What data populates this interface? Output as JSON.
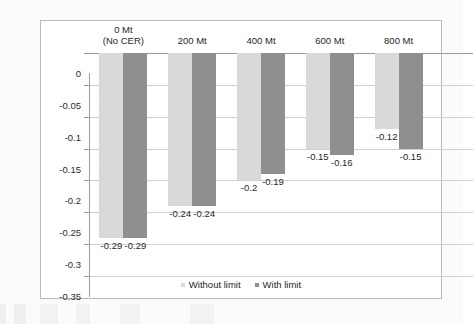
{
  "chart_data": {
    "type": "bar",
    "title": "",
    "subtitle": "",
    "xlabel": "",
    "ylabel": "",
    "categories": [
      "0 Mt\n(No CER)",
      "200 Mt",
      "400 Mt",
      "600 Mt",
      "800 Mt"
    ],
    "category_lines": [
      [
        "0 Mt",
        "(No CER)"
      ],
      [
        "200 Mt"
      ],
      [
        "400 Mt"
      ],
      [
        "600 Mt"
      ],
      [
        "800 Mt"
      ]
    ],
    "series": [
      {
        "name": "Without limit",
        "color": "#d9d9d9",
        "values": [
          -0.29,
          -0.24,
          -0.2,
          -0.15,
          -0.12
        ],
        "labels": [
          "-0.29",
          "-0.24",
          "-0.2",
          "-0.15",
          "-0.12"
        ]
      },
      {
        "name": "With limit",
        "color": "#8f8f8f",
        "values": [
          -0.29,
          -0.24,
          -0.19,
          -0.16,
          -0.15
        ],
        "labels": [
          "-0.29",
          "-0.24",
          "-0.19",
          "-0.16",
          "-0.15"
        ]
      }
    ],
    "ylim": [
      -0.35,
      0
    ],
    "yticks": [
      0,
      -0.05,
      -0.1,
      -0.15,
      -0.2,
      -0.25,
      -0.3,
      -0.35
    ],
    "ytick_labels": [
      "0",
      "-0.05",
      "-0.1",
      "-0.15",
      "-0.2",
      "-0.25",
      "-0.3",
      "-0.35"
    ],
    "grid": true,
    "legend_position": "bottom"
  },
  "legend": {
    "items": [
      {
        "label": "Without limit",
        "color": "#d9d9d9"
      },
      {
        "label": "With limit",
        "color": "#8f8f8f"
      }
    ]
  }
}
